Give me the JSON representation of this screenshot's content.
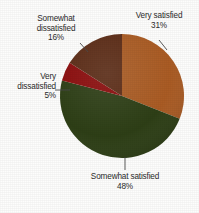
{
  "chart_data": {
    "type": "pie",
    "title": "",
    "subtitle": "",
    "xlabel": "",
    "ylabel": "",
    "legend_position": "none",
    "grid": false,
    "start_angle_deg": 0,
    "direction": "clockwise",
    "categories": [
      "Very satisfied",
      "Somewhat satisfied",
      "Very dissatisfied",
      "Somewhat dissatisfied"
    ],
    "values": [
      31,
      48,
      5,
      16
    ],
    "unit": "%",
    "slices": [
      {
        "label": "Very satisfied",
        "value": 31,
        "value_text": "31%",
        "color": "#a95a22",
        "leader_line": true
      },
      {
        "label": "Somewhat satisfied",
        "value": 48,
        "value_text": "48%",
        "color": "#2c3d14",
        "leader_line": true
      },
      {
        "label": "Very dissatisfied",
        "value": 5,
        "value_text": "5%",
        "color": "#8a0a0a",
        "leader_line": true
      },
      {
        "label": "Somewhat dissatisfied",
        "value": 16,
        "value_text": "16%",
        "color": "#5a2a14",
        "leader_line": true
      }
    ]
  },
  "labels": {
    "very_satisfied": {
      "line1": "Very satisfied",
      "pct": "31%"
    },
    "somewhat_dissatisfied": {
      "line1": "Somewhat",
      "line2": "dissatisfied",
      "pct": "16%"
    },
    "very_dissatisfied": {
      "line1": "Very",
      "line2": "dissatisfied",
      "pct": "5%"
    },
    "somewhat_satisfied": {
      "line1": "Somewhat satisfied",
      "pct": "48%"
    }
  },
  "style": {
    "background": "#fdfdfc",
    "text_color": "#2b2b2b",
    "leader_color": "#4a4a4a"
  }
}
